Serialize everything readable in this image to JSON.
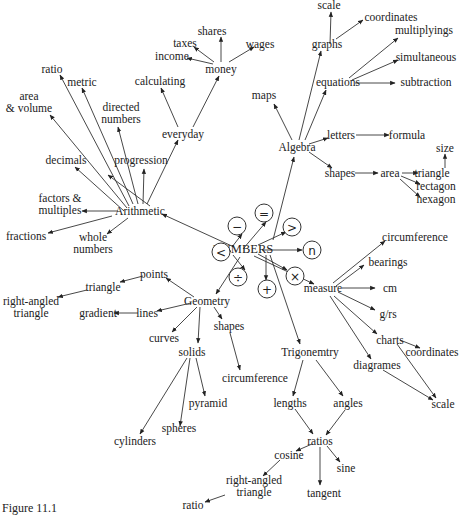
{
  "caption": "Figure 11.1",
  "center": {
    "id": "numbers",
    "label": "NUMBERS",
    "x": 243,
    "y": 249
  },
  "nodes": [
    {
      "id": "numbers",
      "label": "NUMBERS",
      "x": 243,
      "y": 249,
      "big": true
    },
    {
      "id": "arithmetic",
      "label": "Arithmetic",
      "x": 140,
      "y": 211
    },
    {
      "id": "algebra",
      "label": "Algebra",
      "x": 297,
      "y": 147
    },
    {
      "id": "geometry",
      "label": "Geometry",
      "x": 207,
      "y": 301
    },
    {
      "id": "measure",
      "label": "measure",
      "x": 323,
      "y": 288
    },
    {
      "id": "trigonemtry",
      "label": "Trigonemtry",
      "x": 310,
      "y": 352
    },
    {
      "id": "ratio_a",
      "label": "ratio",
      "x": 52,
      "y": 69
    },
    {
      "id": "metric",
      "label": "metric",
      "x": 82,
      "y": 82
    },
    {
      "id": "area_volume",
      "label": "area\n& volume",
      "x": 29,
      "y": 102
    },
    {
      "id": "directed_numbers",
      "label": "directed\nnumbers",
      "x": 121,
      "y": 113
    },
    {
      "id": "decimals",
      "label": "decimals",
      "x": 66,
      "y": 160
    },
    {
      "id": "progression",
      "label": "progression",
      "x": 141,
      "y": 160
    },
    {
      "id": "factors",
      "label": "factors &\nmultiples",
      "x": 60,
      "y": 204
    },
    {
      "id": "fractions",
      "label": "fractions",
      "x": 26,
      "y": 236
    },
    {
      "id": "whole_numbers",
      "label": "whole\nnumbers",
      "x": 93,
      "y": 243
    },
    {
      "id": "everyday",
      "label": "everyday",
      "x": 183,
      "y": 134
    },
    {
      "id": "calculating",
      "label": "calculating",
      "x": 160,
      "y": 81
    },
    {
      "id": "money",
      "label": "money",
      "x": 221,
      "y": 69
    },
    {
      "id": "income",
      "label": "income",
      "x": 172,
      "y": 56
    },
    {
      "id": "taxes",
      "label": "taxes",
      "x": 185,
      "y": 43
    },
    {
      "id": "shares",
      "label": "shares",
      "x": 212,
      "y": 31
    },
    {
      "id": "wages",
      "label": "wages",
      "x": 260,
      "y": 44
    },
    {
      "id": "maps",
      "label": "maps",
      "x": 264,
      "y": 95
    },
    {
      "id": "graphs",
      "label": "graphs",
      "x": 327,
      "y": 44
    },
    {
      "id": "scale_top",
      "label": "scale",
      "x": 329,
      "y": 5
    },
    {
      "id": "coordinates_top",
      "label": "coordinates",
      "x": 391,
      "y": 17
    },
    {
      "id": "equations",
      "label": "equations",
      "x": 338,
      "y": 82
    },
    {
      "id": "multiplyings",
      "label": "multiplyings",
      "x": 424,
      "y": 30
    },
    {
      "id": "simultaneous",
      "label": "simultaneous",
      "x": 426,
      "y": 57
    },
    {
      "id": "subtraction",
      "label": "subtraction",
      "x": 426,
      "y": 82
    },
    {
      "id": "letters",
      "label": "letters",
      "x": 341,
      "y": 135
    },
    {
      "id": "formula",
      "label": "formula",
      "x": 407,
      "y": 135
    },
    {
      "id": "size",
      "label": "size",
      "x": 445,
      "y": 148
    },
    {
      "id": "shapes_alg",
      "label": "shapes",
      "x": 340,
      "y": 173
    },
    {
      "id": "area_alg",
      "label": "area",
      "x": 390,
      "y": 173
    },
    {
      "id": "triangle_alg",
      "label": "triangle",
      "x": 432,
      "y": 173
    },
    {
      "id": "rectagon",
      "label": "rectagon",
      "x": 436,
      "y": 186
    },
    {
      "id": "hexagon",
      "label": "hexagon",
      "x": 436,
      "y": 199
    },
    {
      "id": "circumference_m",
      "label": "circumference",
      "x": 415,
      "y": 237
    },
    {
      "id": "bearings",
      "label": "bearings",
      "x": 388,
      "y": 262
    },
    {
      "id": "cm",
      "label": "cm",
      "x": 390,
      "y": 288
    },
    {
      "id": "grs",
      "label": "g/rs",
      "x": 388,
      "y": 314
    },
    {
      "id": "charts",
      "label": "charts",
      "x": 390,
      "y": 340
    },
    {
      "id": "coordinates_m",
      "label": "coordinates",
      "x": 432,
      "y": 352
    },
    {
      "id": "diagrames",
      "label": "diagrames",
      "x": 377,
      "y": 365
    },
    {
      "id": "scale_m",
      "label": "scale",
      "x": 443,
      "y": 404
    },
    {
      "id": "points",
      "label": "points",
      "x": 154,
      "y": 274
    },
    {
      "id": "triangle_g",
      "label": "triangle",
      "x": 103,
      "y": 287
    },
    {
      "id": "right_angled_g",
      "label": "right-angled\ntriangle",
      "x": 31,
      "y": 307
    },
    {
      "id": "lines",
      "label": "lines",
      "x": 147,
      "y": 313
    },
    {
      "id": "gradient",
      "label": "gradient",
      "x": 98,
      "y": 313
    },
    {
      "id": "curves",
      "label": "curves",
      "x": 164,
      "y": 338
    },
    {
      "id": "solids",
      "label": "solids",
      "x": 192,
      "y": 352
    },
    {
      "id": "shapes_g",
      "label": "shapes",
      "x": 229,
      "y": 326
    },
    {
      "id": "circumference_g",
      "label": "circumference",
      "x": 255,
      "y": 378
    },
    {
      "id": "pyramid",
      "label": "pyramid",
      "x": 208,
      "y": 403
    },
    {
      "id": "spheres",
      "label": "spheres",
      "x": 179,
      "y": 428
    },
    {
      "id": "cylinders",
      "label": "cylinders",
      "x": 135,
      "y": 441
    },
    {
      "id": "lengths",
      "label": "lengths",
      "x": 290,
      "y": 403
    },
    {
      "id": "angles",
      "label": "angles",
      "x": 348,
      "y": 403
    },
    {
      "id": "ratios",
      "label": "ratios",
      "x": 320,
      "y": 441
    },
    {
      "id": "cosine",
      "label": "cosine",
      "x": 289,
      "y": 455
    },
    {
      "id": "sine",
      "label": "sine",
      "x": 346,
      "y": 468
    },
    {
      "id": "tangent",
      "label": "tangent",
      "x": 324,
      "y": 493
    },
    {
      "id": "right_angled_t",
      "label": "right-angled\ntriangle",
      "x": 254,
      "y": 486
    },
    {
      "id": "ratio_t",
      "label": "ratio",
      "x": 193,
      "y": 505
    }
  ],
  "operators": [
    {
      "id": "op_eq",
      "symbol": "=",
      "x": 264,
      "y": 213
    },
    {
      "id": "op_minus",
      "symbol": "−",
      "x": 237,
      "y": 226
    },
    {
      "id": "op_gt",
      "symbol": ">",
      "x": 292,
      "y": 227
    },
    {
      "id": "op_lt",
      "symbol": "<",
      "x": 221,
      "y": 252
    },
    {
      "id": "op_n",
      "symbol": "n",
      "x": 312,
      "y": 250
    },
    {
      "id": "op_div",
      "symbol": "÷",
      "x": 238,
      "y": 277
    },
    {
      "id": "op_times",
      "symbol": "×",
      "x": 295,
      "y": 276
    },
    {
      "id": "op_plus",
      "symbol": "+",
      "x": 267,
      "y": 289
    }
  ],
  "edges": [
    [
      243,
      249,
      266,
      222
    ],
    [
      232,
      247,
      242,
      234
    ],
    [
      258,
      245,
      286,
      232
    ],
    [
      228,
      252,
      231,
      251
    ],
    [
      262,
      250,
      302,
      250
    ],
    [
      233,
      255,
      245,
      270
    ],
    [
      258,
      254,
      287,
      270
    ],
    [
      266,
      255,
      266,
      280
    ],
    [
      234,
      247,
      162,
      214
    ],
    [
      240,
      257,
      216,
      294
    ],
    [
      254,
      256,
      314,
      284
    ],
    [
      270,
      255,
      300,
      344
    ],
    [
      273,
      240,
      294,
      157
    ],
    [
      150,
      206,
      108,
      175
    ],
    [
      143,
      204,
      144,
      169
    ],
    [
      138,
      204,
      118,
      127
    ],
    [
      133,
      204,
      82,
      88
    ],
    [
      129,
      206,
      60,
      75
    ],
    [
      127,
      208,
      50,
      115
    ],
    [
      124,
      211,
      75,
      167
    ],
    [
      118,
      211,
      82,
      211
    ],
    [
      112,
      216,
      48,
      233
    ],
    [
      128,
      218,
      107,
      234
    ],
    [
      147,
      204,
      178,
      140
    ],
    [
      178,
      127,
      161,
      88
    ],
    [
      193,
      127,
      219,
      76
    ],
    [
      213,
      64,
      187,
      58
    ],
    [
      214,
      62,
      194,
      47
    ],
    [
      221,
      62,
      221,
      37
    ],
    [
      229,
      62,
      254,
      47
    ],
    [
      292,
      140,
      274,
      104
    ],
    [
      299,
      140,
      321,
      51
    ],
    [
      305,
      140,
      326,
      90
    ],
    [
      330,
      44,
      331,
      12
    ],
    [
      336,
      39,
      363,
      20
    ],
    [
      349,
      78,
      398,
      38
    ],
    [
      352,
      80,
      398,
      60
    ],
    [
      355,
      83,
      395,
      83
    ],
    [
      309,
      144,
      328,
      138
    ],
    [
      356,
      135,
      389,
      135
    ],
    [
      309,
      152,
      332,
      168
    ],
    [
      445,
      168,
      445,
      154
    ],
    [
      355,
      173,
      378,
      173
    ],
    [
      402,
      173,
      418,
      173
    ],
    [
      401,
      176,
      420,
      184
    ],
    [
      400,
      179,
      420,
      197
    ],
    [
      333,
      283,
      385,
      241
    ],
    [
      336,
      286,
      364,
      265
    ],
    [
      342,
      288,
      375,
      288
    ],
    [
      338,
      292,
      375,
      310
    ],
    [
      334,
      296,
      377,
      334
    ],
    [
      330,
      296,
      371,
      359
    ],
    [
      400,
      340,
      420,
      348
    ],
    [
      397,
      344,
      436,
      398
    ],
    [
      383,
      370,
      433,
      400
    ],
    [
      194,
      297,
      166,
      278
    ],
    [
      143,
      276,
      120,
      282
    ],
    [
      87,
      290,
      58,
      297
    ],
    [
      191,
      303,
      157,
      311
    ],
    [
      138,
      313,
      114,
      313
    ],
    [
      197,
      307,
      172,
      332
    ],
    [
      200,
      307,
      198,
      343
    ],
    [
      214,
      307,
      222,
      319
    ],
    [
      230,
      333,
      240,
      370
    ],
    [
      190,
      358,
      180,
      426
    ],
    [
      196,
      358,
      205,
      396
    ],
    [
      187,
      358,
      140,
      434
    ],
    [
      303,
      360,
      293,
      396
    ],
    [
      316,
      360,
      343,
      396
    ],
    [
      295,
      409,
      313,
      434
    ],
    [
      345,
      410,
      326,
      435
    ],
    [
      312,
      444,
      296,
      451
    ],
    [
      320,
      447,
      320,
      485
    ],
    [
      327,
      446,
      340,
      462
    ],
    [
      280,
      460,
      263,
      476
    ],
    [
      225,
      495,
      205,
      502
    ]
  ]
}
